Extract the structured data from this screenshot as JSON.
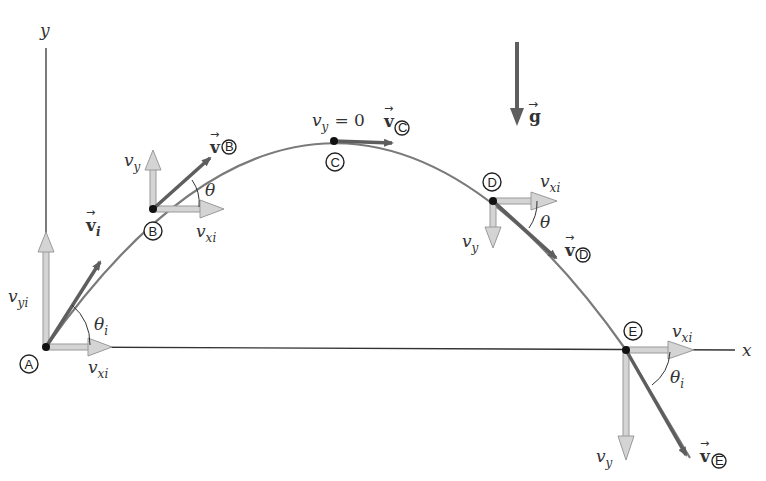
{
  "diagram": {
    "axes": {
      "x_label": "x",
      "y_label": "y"
    },
    "gravity": {
      "label": "g",
      "direction": "down"
    },
    "points": [
      {
        "id": "A",
        "label": "A",
        "x": 46,
        "y": 347,
        "vx_label": "v",
        "vx_sub": "xi",
        "vy_label": "v",
        "vy_sub": "yi",
        "vel_label": "v",
        "vel_sub": "i",
        "angle_label": "θ",
        "angle_sub": "i"
      },
      {
        "id": "B",
        "label": "B",
        "x": 153,
        "y": 209,
        "vx_label": "v",
        "vx_sub": "xi",
        "vy_label": "v",
        "vy_sub": "y",
        "vel_label": "v",
        "vel_sub": "B",
        "angle_label": "θ"
      },
      {
        "id": "C",
        "label": "C",
        "x": 334,
        "y": 141,
        "vy_text": "v",
        "vy_sub": "y",
        "vy_eq": "= 0",
        "vel_label": "v",
        "vel_sub": "C"
      },
      {
        "id": "D",
        "label": "D",
        "x": 493,
        "y": 201,
        "vx_label": "v",
        "vx_sub": "xi",
        "vy_label": "v",
        "vy_sub": "y",
        "vel_label": "v",
        "vel_sub": "D",
        "angle_label": "θ"
      },
      {
        "id": "E",
        "label": "E",
        "x": 626,
        "y": 350,
        "vx_label": "v",
        "vx_sub": "xi",
        "vy_label": "v",
        "vy_sub": "y",
        "vel_label": "v",
        "vel_sub": "E",
        "angle_label": "θ",
        "angle_sub": "i"
      }
    ],
    "colors": {
      "trajectory": "#7a7a7a",
      "velocity_vector": "#5e5e5e",
      "component_fill": "#d4d4d4",
      "component_stroke": "#9a9a9a",
      "axis": "#333333"
    }
  }
}
